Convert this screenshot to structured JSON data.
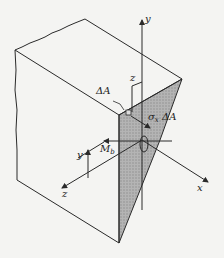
{
  "diagram": {
    "labels": {
      "y_axis": "y",
      "x_axis": "x",
      "z_axis": "z",
      "z_offset": "z",
      "y_offset": "y",
      "dA": "ΔA",
      "stress_sigma": "σ",
      "stress_sub": "x",
      "stress_dA": "ΔA",
      "moment_M": "M",
      "moment_sub": "b"
    },
    "colors": {
      "line": "#2a2a2a",
      "shade": "#a8a8a8",
      "background": "#f4f4f2"
    }
  }
}
